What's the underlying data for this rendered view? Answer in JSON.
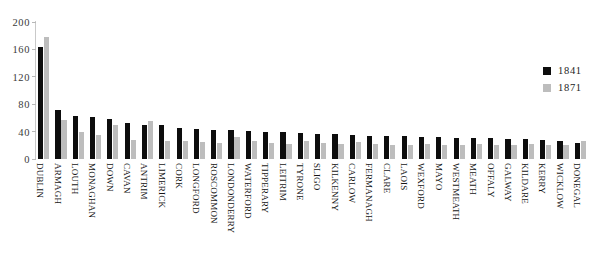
{
  "chart_data": {
    "type": "bar",
    "title": "",
    "subtitle": "",
    "xlabel": "",
    "ylabel": "",
    "ylim": [
      0,
      200
    ],
    "yticks": [
      0,
      40,
      80,
      120,
      160,
      200
    ],
    "grid": false,
    "legend_position": "right",
    "orientation": "vertical",
    "categories": [
      "DUBLIN",
      "ARMAGH",
      "LOUTH",
      "MONAGHAN",
      "DOWN",
      "CAVAN",
      "ANTRIM",
      "LIMERICK",
      "CORK",
      "LONGFORD",
      "ROSCOMMON",
      "LONDONDERRY",
      "WATERFORD",
      "TIPPERARY",
      "LEITRIM",
      "TYRONE",
      "SLIGO",
      "KILKENNY",
      "CARLOW",
      "FERMANAGH",
      "CLARE",
      "LAOIS",
      "WEXFORD",
      "MAYO",
      "WESTMEATH",
      "MEATH",
      "OFFALY",
      "GALWAY",
      "KILDARE",
      "KERRY",
      "WICKLOW",
      "DONEGAL"
    ],
    "series": [
      {
        "name": "1841",
        "color": "#0d0d0d",
        "values": [
          163,
          72,
          63,
          62,
          58,
          52,
          50,
          50,
          46,
          44,
          43,
          42,
          41,
          40,
          39,
          38,
          37,
          36,
          35,
          34,
          34,
          33,
          32,
          32,
          31,
          31,
          30,
          29,
          29,
          28,
          27,
          23
        ]
      },
      {
        "name": "1871",
        "color": "#bdbdbd",
        "values": [
          178,
          57,
          40,
          35,
          49,
          28,
          55,
          27,
          27,
          25,
          24,
          32,
          26,
          23,
          22,
          26,
          23,
          22,
          25,
          22,
          21,
          21,
          22,
          20,
          21,
          22,
          20,
          21,
          22,
          20,
          21,
          26
        ]
      }
    ]
  },
  "legend": {
    "items": [
      {
        "label": "1841",
        "color": "#0d0d0d"
      },
      {
        "label": "1871",
        "color": "#bdbdbd"
      }
    ]
  },
  "axis": {
    "y_tick_labels": [
      "0",
      "40",
      "80",
      "120",
      "160",
      "200"
    ]
  }
}
